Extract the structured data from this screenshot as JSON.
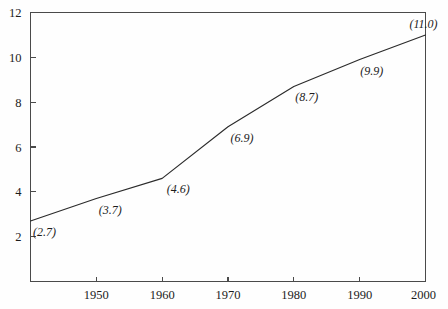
{
  "chart_data": {
    "type": "line",
    "title": "",
    "subtitle": "",
    "xlabel": "",
    "ylabel": "",
    "x": [
      1940,
      1950,
      1960,
      1970,
      1980,
      1990,
      2000
    ],
    "values": [
      2.7,
      3.7,
      4.6,
      6.9,
      8.7,
      9.9,
      11.0
    ],
    "point_labels": [
      "(2.7)",
      "(3.7)",
      "(4.6)",
      "(6.9)",
      "(8.7)",
      "(9.9)",
      "(11.0)"
    ],
    "xlim": [
      1940,
      2000
    ],
    "ylim": [
      0,
      12
    ],
    "xticks": [
      1950,
      1960,
      1970,
      1980,
      1990,
      2000
    ],
    "xtick_labels": [
      "1950",
      "1960",
      "1970",
      "1980",
      "1990",
      "2000"
    ],
    "yticks": [
      2,
      4,
      6,
      8,
      10,
      12
    ],
    "ytick_labels": [
      "2",
      "4",
      "6",
      "8",
      "10",
      "12"
    ],
    "grid": false,
    "legend": null,
    "series": [
      {
        "name": "",
        "values": [
          2.7,
          3.7,
          4.6,
          6.9,
          8.7,
          9.9,
          11.0
        ]
      }
    ],
    "colors": {
      "line": "#2b2b2b",
      "axis": "#4a4a4a",
      "text": "#1c1c1c",
      "background": "#fefefe"
    }
  }
}
